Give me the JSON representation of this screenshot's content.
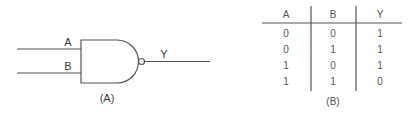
{
  "gate_diagram": {
    "type": "NAND gate",
    "inputs": [
      "A",
      "B"
    ],
    "output": "Y",
    "caption": "(A)"
  },
  "truth_table": {
    "headers": [
      "A",
      "B",
      "Y"
    ],
    "rows": [
      [
        "0",
        "0",
        "1"
      ],
      [
        "0",
        "1",
        "1"
      ],
      [
        "1",
        "0",
        "1"
      ],
      [
        "1",
        "1",
        "0"
      ]
    ],
    "caption": "(B)"
  },
  "colors": {
    "line": "#555555",
    "text": "#3a3a3a"
  }
}
